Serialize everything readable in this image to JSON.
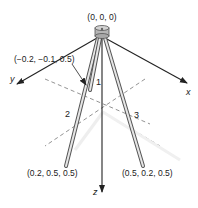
{
  "origin_label": "(0, 0, 0)",
  "axes": {
    "x": "x",
    "y": "y",
    "z": "z"
  },
  "points": {
    "leg1_end": "(−0.2, −0.1, 0.5)",
    "leg2_end": "(0.2, 0.5, 0.5)",
    "leg3_end": "(0.5, 0.2, 0.5)"
  },
  "leg_labels": {
    "leg1": "1",
    "leg2": "2",
    "leg3": "3"
  },
  "colors": {
    "line": "#222222",
    "leg_fill": "#e6e6e6",
    "leg_stroke": "#555555",
    "dashed": "#777777",
    "hub": "#b5b5b5"
  }
}
